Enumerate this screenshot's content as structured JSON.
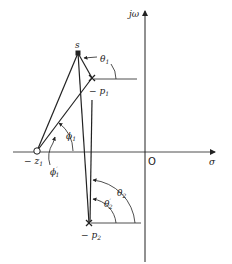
{
  "diagram": {
    "type": "s-plane pole-zero angle diagram",
    "axes": {
      "imag_label": "jω",
      "real_label": "σ",
      "origin_label": "O"
    },
    "points": {
      "s": {
        "label": "s"
      },
      "p1": {
        "label_prefix": "− p",
        "label_sub": "1"
      },
      "p2": {
        "label_prefix": "− p",
        "label_sub": "2"
      },
      "z1": {
        "label_prefix": "− z",
        "label_sub": "1"
      }
    },
    "angles": {
      "theta1": {
        "sym": "θ",
        "sub": "1"
      },
      "theta2": {
        "sym": "θ",
        "sub": "2"
      },
      "theta2p": {
        "sym": "θ",
        "sub": "2",
        "prime": "′"
      },
      "phi1": {
        "sym": "ϕ",
        "sub": "1"
      },
      "phi1p": {
        "sym": "ϕ",
        "sub": "1",
        "prime": "′"
      }
    },
    "colors": {
      "ink": "#222222",
      "background": "#ffffff"
    }
  }
}
